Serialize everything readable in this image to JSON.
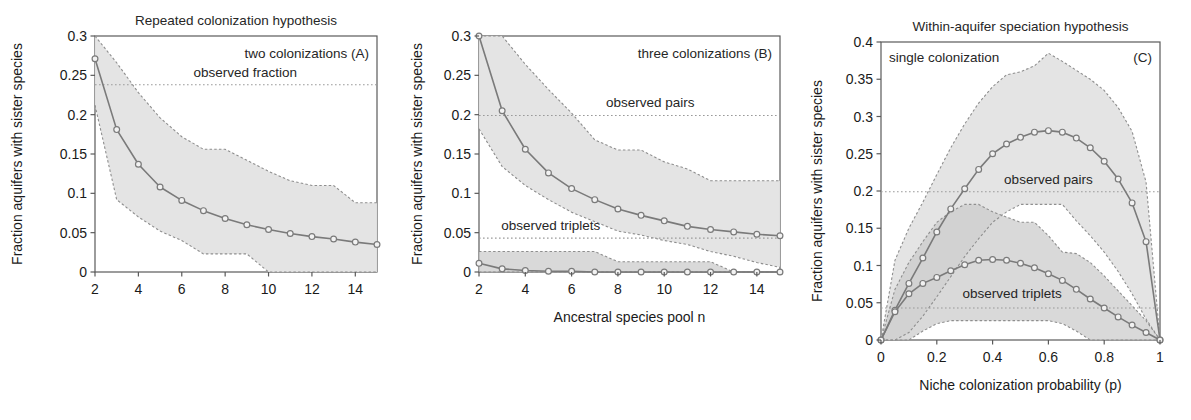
{
  "figure": {
    "ylabel": "Fraction aquifers with sister species",
    "band_fill": "#e3e3e3",
    "band_fill_dark": "#cccccc",
    "line_color": "#7a7a7a",
    "marker_face": "#f2f2f2",
    "axis_color": "#5a5a5a",
    "ref_color": "#9a9a9a"
  },
  "chart_data": [
    {
      "type": "line",
      "panel": "A",
      "title": "Repeated colonization hypothesis",
      "annotation": "two colonizations (A)",
      "reference_label": "observed fraction",
      "reference_value": 0.238,
      "xlabel": "",
      "ylabel": "Fraction aquifers with sister species",
      "xlim": [
        2,
        15
      ],
      "ylim": [
        0,
        0.3
      ],
      "xticks": [
        2,
        4,
        6,
        8,
        10,
        12,
        14
      ],
      "yticks": [
        0,
        0.05,
        0.1,
        0.15,
        0.2,
        0.25,
        0.3
      ],
      "grid": false,
      "legend": "none",
      "x": [
        2,
        3,
        4,
        5,
        6,
        7,
        8,
        9,
        10,
        11,
        12,
        13,
        14,
        15
      ],
      "series": [
        {
          "name": "two colonizations mean",
          "values": [
            0.271,
            0.181,
            0.137,
            0.108,
            0.091,
            0.078,
            0.068,
            0.06,
            0.054,
            0.049,
            0.045,
            0.042,
            0.038,
            0.035
          ],
          "upper": [
            0.3,
            0.266,
            0.228,
            0.196,
            0.172,
            0.156,
            0.156,
            0.142,
            0.128,
            0.116,
            0.11,
            0.11,
            0.088,
            0.088
          ],
          "lower": [
            0.212,
            0.092,
            0.07,
            0.052,
            0.04,
            0.023,
            0.023,
            0.023,
            0.0,
            0.0,
            0.0,
            0.0,
            0.0,
            0.0
          ]
        }
      ]
    },
    {
      "type": "line",
      "panel": "B",
      "title": "",
      "annotation": "three colonizations (B)",
      "reference_labels": [
        "observed pairs",
        "observed triplets"
      ],
      "reference_values": [
        0.199,
        0.043
      ],
      "xlabel": "Ancestral species pool n",
      "ylabel": "Fraction aquifers with sister species",
      "xlim": [
        2,
        15
      ],
      "ylim": [
        0,
        0.3
      ],
      "xticks": [
        2,
        4,
        6,
        8,
        10,
        12,
        14
      ],
      "yticks": [
        0,
        0.05,
        0.1,
        0.15,
        0.2,
        0.25,
        0.3
      ],
      "grid": false,
      "legend": "none",
      "x": [
        2,
        3,
        4,
        5,
        6,
        7,
        8,
        9,
        10,
        11,
        12,
        13,
        14,
        15
      ],
      "series": [
        {
          "name": "pairs",
          "values": [
            0.3,
            0.205,
            0.156,
            0.126,
            0.106,
            0.092,
            0.08,
            0.072,
            0.065,
            0.058,
            0.054,
            0.051,
            0.048,
            0.046
          ],
          "upper": [
            0.3,
            0.3,
            0.264,
            0.232,
            0.202,
            0.168,
            0.155,
            0.155,
            0.14,
            0.131,
            0.116,
            0.116,
            0.116,
            0.116
          ],
          "lower": [
            0.182,
            0.134,
            0.11,
            0.092,
            0.076,
            0.064,
            0.052,
            0.047,
            0.04,
            0.035,
            0.026,
            0.02,
            0.012,
            0.006
          ]
        },
        {
          "name": "triplets",
          "values": [
            0.011,
            0.004,
            0.002,
            0.001,
            0.001,
            0.0,
            0.0,
            0.0,
            0.0,
            0.0,
            0.0,
            0.0,
            0.0,
            0.0
          ],
          "upper": [
            0.026,
            0.026,
            0.026,
            0.026,
            0.026,
            0.026,
            0.013,
            0.013,
            0.013,
            0.013,
            0.013,
            0.0,
            0.0,
            0.0
          ],
          "lower": [
            0.0,
            0.0,
            0.0,
            0.0,
            0.0,
            0.0,
            0.0,
            0.0,
            0.0,
            0.0,
            0.0,
            0.0,
            0.0,
            0.0
          ]
        }
      ]
    },
    {
      "type": "line",
      "panel": "C",
      "title": "Within-aquifer speciation hypothesis",
      "annotation": "single colonization",
      "panel_tag": "(C)",
      "reference_labels": [
        "observed pairs",
        "observed triplets"
      ],
      "reference_values": [
        0.199,
        0.043
      ],
      "xlabel": "Niche colonization probability (p)",
      "ylabel": "Fraction aquifers with sister species",
      "xlim": [
        0,
        1
      ],
      "ylim": [
        0,
        0.4
      ],
      "xticks": [
        0,
        0.2,
        0.4,
        0.6,
        0.8,
        1
      ],
      "yticks": [
        0,
        0.05,
        0.1,
        0.15,
        0.2,
        0.25,
        0.3,
        0.35,
        0.4
      ],
      "grid": false,
      "legend": "none",
      "x": [
        0,
        0.05,
        0.1,
        0.15,
        0.2,
        0.25,
        0.3,
        0.35,
        0.4,
        0.45,
        0.5,
        0.55,
        0.6,
        0.65,
        0.7,
        0.75,
        0.8,
        0.85,
        0.9,
        0.95,
        1
      ],
      "series": [
        {
          "name": "pairs",
          "values": [
            0.0,
            0.04,
            0.076,
            0.11,
            0.145,
            0.176,
            0.203,
            0.229,
            0.25,
            0.263,
            0.272,
            0.279,
            0.281,
            0.279,
            0.271,
            0.258,
            0.24,
            0.216,
            0.184,
            0.132,
            0.0
          ],
          "upper": [
            0.0,
            0.107,
            0.15,
            0.185,
            0.222,
            0.258,
            0.29,
            0.318,
            0.34,
            0.356,
            0.36,
            0.368,
            0.385,
            0.374,
            0.362,
            0.35,
            0.335,
            0.312,
            0.28,
            0.212,
            0.0
          ],
          "lower": [
            0.0,
            0.0,
            0.01,
            0.032,
            0.058,
            0.085,
            0.112,
            0.136,
            0.158,
            0.172,
            0.182,
            0.182,
            0.182,
            0.182,
            0.16,
            0.14,
            0.118,
            0.092,
            0.062,
            0.028,
            0.0
          ]
        },
        {
          "name": "triplets",
          "values": [
            0.0,
            0.038,
            0.062,
            0.076,
            0.084,
            0.093,
            0.101,
            0.107,
            0.108,
            0.107,
            0.103,
            0.097,
            0.089,
            0.08,
            0.068,
            0.055,
            0.043,
            0.031,
            0.02,
            0.01,
            0.0
          ],
          "upper": [
            0.0,
            0.068,
            0.104,
            0.132,
            0.158,
            0.172,
            0.182,
            0.182,
            0.172,
            0.165,
            0.158,
            0.158,
            0.14,
            0.118,
            0.116,
            0.104,
            0.086,
            0.066,
            0.046,
            0.026,
            0.0
          ],
          "lower": [
            0.0,
            0.0,
            0.0,
            0.012,
            0.022,
            0.026,
            0.026,
            0.026,
            0.026,
            0.026,
            0.026,
            0.026,
            0.026,
            0.022,
            0.012,
            0.0,
            0.0,
            0.0,
            0.0,
            0.0,
            0.0
          ]
        }
      ]
    }
  ]
}
